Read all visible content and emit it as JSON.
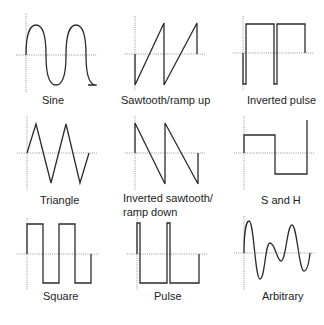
{
  "diagram": {
    "panels": [
      {
        "id": "sine",
        "label": "Sine"
      },
      {
        "id": "sawtooth",
        "label": "Sawtooth/ramp up"
      },
      {
        "id": "inverted-pulse",
        "label": "Inverted pulse"
      },
      {
        "id": "triangle",
        "label": "Triangle"
      },
      {
        "id": "inverted-sawtooth",
        "label_line1": "Inverted sawtooth/",
        "label_line2": "ramp down"
      },
      {
        "id": "s-and-h",
        "label": "S and H"
      },
      {
        "id": "square",
        "label": "Square"
      },
      {
        "id": "pulse",
        "label": "Pulse"
      },
      {
        "id": "arbitrary",
        "label": "Arbitrary"
      }
    ],
    "colors": {
      "waveform": "#2b2b2b",
      "axis": "#888888",
      "background": "#ffffff"
    }
  }
}
